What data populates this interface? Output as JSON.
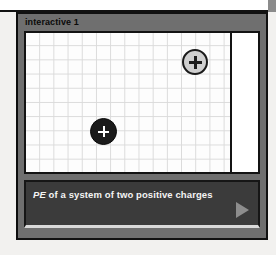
{
  "panel": {
    "title": "interactive 1",
    "background_color": "#6f6f6f",
    "border_color": "#111111"
  },
  "stage": {
    "name": "simulation-stage",
    "grid": {
      "visible": true,
      "cell_size_px": 14,
      "line_color": "#dadada",
      "background_color": "#fdfdfd"
    },
    "divider": {
      "orientation": "vertical",
      "color": "#141414"
    },
    "readout_panel": {
      "background_color": "#ffffff",
      "content": ""
    },
    "charges": [
      {
        "id": "charge-a",
        "label": "+",
        "sign": "positive",
        "fill_color": "#cfcfcf",
        "border_color": "#1a1a1a",
        "glyph_color": "#1c1c1c",
        "x": 169,
        "y": 29,
        "radius": 13
      },
      {
        "id": "charge-b",
        "label": "+",
        "sign": "positive",
        "fill_color": "#1b1b1b",
        "border_color": "#0a0a0a",
        "glyph_color": "#ffffff",
        "x": 77,
        "y": 98,
        "radius": 13
      }
    ]
  },
  "caption": {
    "term": "PE",
    "rest": " of a system of two positive charges",
    "full_text": "PE of a system of two positive charges",
    "background_color": "#3b3b3b",
    "text_color": "#f4f4f4",
    "play_label": "play",
    "play_icon": "play-triangle-icon",
    "play_color": "#8d8d8d"
  }
}
